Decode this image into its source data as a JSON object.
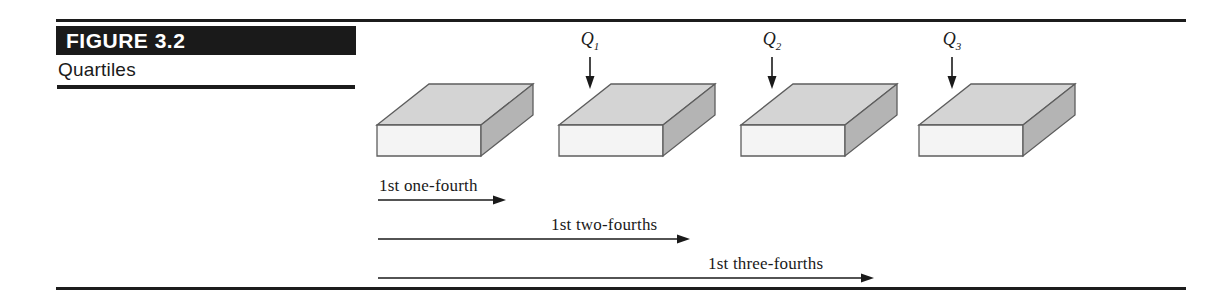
{
  "figure": {
    "label": "FIGURE 3.2",
    "caption": "Quartiles",
    "bar_color": "#1a1a1a",
    "rule_color": "#1c1c1c"
  },
  "diagram": {
    "slab_colors": {
      "top_face": "#d4d4d4",
      "front_face": "#f4f4f4",
      "side_face": "#b4b4b4",
      "outline": "#5d5d5d"
    },
    "slabs": [
      {
        "name": "slab-1",
        "left": 377,
        "top": 84
      },
      {
        "name": "slab-2",
        "left": 559,
        "top": 84
      },
      {
        "name": "slab-3",
        "left": 741,
        "top": 84
      },
      {
        "name": "slab-4",
        "left": 919,
        "top": 84
      }
    ],
    "quartile_markers": [
      {
        "label": "Q",
        "subscript": "1",
        "left": 570,
        "top": 30,
        "arrow_height": 32
      },
      {
        "label": "Q",
        "subscript": "2",
        "left": 752,
        "top": 30,
        "arrow_height": 32
      },
      {
        "label": "Q",
        "subscript": "3",
        "left": 932,
        "top": 30,
        "arrow_height": 32
      }
    ],
    "measures": [
      {
        "text": "1st one-fourth",
        "label_left": 379,
        "label_top": 176,
        "arrow_left": 378,
        "arrow_top": 194,
        "arrow_width": 128
      },
      {
        "text": "1st two-fourths",
        "label_left": 551,
        "label_top": 215,
        "arrow_left": 378,
        "arrow_top": 233,
        "arrow_width": 312
      },
      {
        "text": "1st three-fourths",
        "label_left": 708,
        "label_top": 254,
        "arrow_left": 378,
        "arrow_top": 272,
        "arrow_width": 496
      }
    ]
  }
}
